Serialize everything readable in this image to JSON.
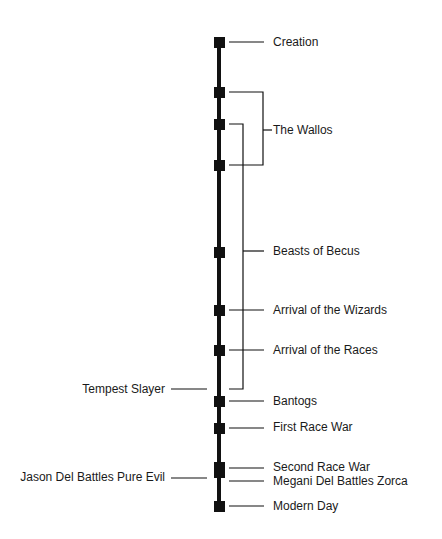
{
  "diagram": {
    "type": "timeline",
    "orientation": "vertical",
    "colors": {
      "line": "#111111",
      "text": "#1a1a1a",
      "background": "#ffffff"
    },
    "events": [
      {
        "id": "creation",
        "label": "Creation",
        "side": "right"
      },
      {
        "id": "the-wallos",
        "label": "The Wallos",
        "side": "right",
        "span": "bracket"
      },
      {
        "id": "beasts-of-becus",
        "label": "Beasts of Becus",
        "side": "right",
        "span": "bracket"
      },
      {
        "id": "arrival-wizards",
        "label": "Arrival of the Wizards",
        "side": "right"
      },
      {
        "id": "arrival-races",
        "label": "Arrival of the Races",
        "side": "right"
      },
      {
        "id": "tempest-slayer",
        "label": "Tempest Slayer",
        "side": "left"
      },
      {
        "id": "bantogs",
        "label": "Bantogs",
        "side": "right"
      },
      {
        "id": "first-race-war",
        "label": "First Race War",
        "side": "right"
      },
      {
        "id": "jason-del",
        "label": "Jason Del Battles Pure Evil",
        "side": "left"
      },
      {
        "id": "second-race-war",
        "label": "Second Race War",
        "side": "right"
      },
      {
        "id": "megani-del",
        "label": "Megani Del Battles Zorca",
        "side": "right"
      },
      {
        "id": "modern-day",
        "label": "Modern Day",
        "side": "right"
      }
    ]
  }
}
